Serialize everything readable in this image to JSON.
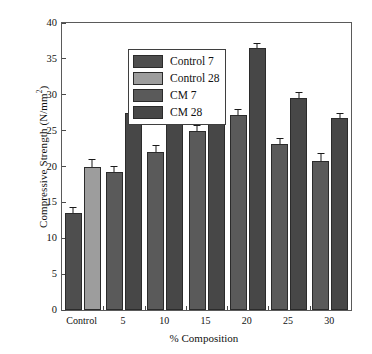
{
  "chart_data": {
    "type": "bar",
    "title": "",
    "xlabel": "% Composition",
    "ylabel": "Compressive Strength (N/mm2)",
    "ylabel_text": "Compressive Strength (N/mm",
    "ylabel_sup": "2",
    "ylabel_tail": ")",
    "categories": [
      "Control",
      "5",
      "10",
      "15",
      "20",
      "25",
      "30"
    ],
    "ylim": [
      0,
      40
    ],
    "yticks": [
      0,
      5,
      10,
      15,
      20,
      25,
      30,
      35,
      40
    ],
    "ytick_labels": [
      "0",
      "5",
      "10",
      "15",
      "20",
      "25",
      "30",
      "35",
      "40"
    ],
    "grid": false,
    "legend_position": "upper-left-inside",
    "series": [
      {
        "name": "Control 7",
        "color": "#4e4e4e",
        "values": [
          13.5,
          null,
          null,
          null,
          null,
          null,
          null
        ],
        "errors": [
          0.5,
          null,
          null,
          null,
          null,
          null,
          null
        ]
      },
      {
        "name": "Control 28",
        "color": "#9d9d9d",
        "values": [
          20.0,
          null,
          null,
          null,
          null,
          null,
          null
        ],
        "errors": [
          0.6,
          null,
          null,
          null,
          null,
          null,
          null
        ]
      },
      {
        "name": "CM 7",
        "color": "#5a5a5a",
        "values": [
          null,
          19.3,
          22.0,
          25.0,
          27.2,
          23.2,
          20.8
        ],
        "errors": [
          null,
          0.3,
          0.6,
          0.4,
          0.4,
          0.3,
          0.6
        ]
      },
      {
        "name": "CM 28",
        "color": "#474747",
        "values": [
          null,
          27.5,
          29.9,
          32.7,
          36.5,
          29.5,
          26.8
        ],
        "errors": [
          null,
          0.4,
          0.3,
          0.3,
          0.3,
          0.4,
          0.2
        ]
      }
    ]
  },
  "legend": {
    "items": [
      {
        "label": "Control 7",
        "color": "#4e4e4e"
      },
      {
        "label": "Control 28",
        "color": "#9d9d9d"
      },
      {
        "label": "CM 7",
        "color": "#5a5a5a"
      },
      {
        "label": "CM 28",
        "color": "#474747"
      }
    ]
  },
  "axes": {
    "x_title": "% Composition",
    "y_title_main": "Compressive Strength (N/mm",
    "y_title_sup": "2",
    "y_title_end": ")"
  }
}
